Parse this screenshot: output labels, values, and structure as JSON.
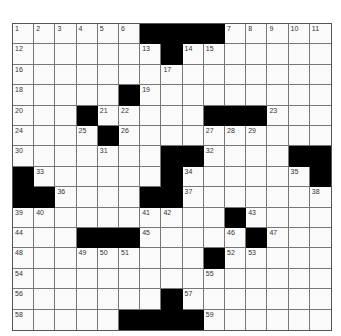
{
  "puzzle": {
    "rows": 15,
    "cols": 15,
    "colors": {
      "black": "#000000",
      "white": "#fafafa",
      "grid_line": "#777777"
    },
    "layout": [
      "......####.....",
      ".......#.......",
      "...............",
      ".....#.........",
      "...#.....###...",
      "....#..........",
      ".......##....##",
      "#......#......#",
      "##....##.......",
      "..........#....",
      "...###.....#...",
      ".........#.....",
      "...............",
      ".......#.......",
      ".....####......"
    ],
    "numbers": [
      {
        "r": 0,
        "c": 0,
        "n": "1"
      },
      {
        "r": 0,
        "c": 1,
        "n": "2"
      },
      {
        "r": 0,
        "c": 2,
        "n": "3"
      },
      {
        "r": 0,
        "c": 3,
        "n": "4"
      },
      {
        "r": 0,
        "c": 4,
        "n": "5"
      },
      {
        "r": 0,
        "c": 5,
        "n": "6"
      },
      {
        "r": 0,
        "c": 10,
        "n": "7"
      },
      {
        "r": 0,
        "c": 11,
        "n": "8"
      },
      {
        "r": 0,
        "c": 12,
        "n": "9"
      },
      {
        "r": 0,
        "c": 13,
        "n": "10"
      },
      {
        "r": 0,
        "c": 14,
        "n": "11"
      },
      {
        "r": 1,
        "c": 0,
        "n": "12"
      },
      {
        "r": 1,
        "c": 6,
        "n": "13"
      },
      {
        "r": 1,
        "c": 8,
        "n": "14"
      },
      {
        "r": 1,
        "c": 9,
        "n": "15"
      },
      {
        "r": 2,
        "c": 0,
        "n": "16"
      },
      {
        "r": 2,
        "c": 7,
        "n": "17"
      },
      {
        "r": 3,
        "c": 0,
        "n": "18"
      },
      {
        "r": 3,
        "c": 6,
        "n": "19"
      },
      {
        "r": 4,
        "c": 0,
        "n": "20"
      },
      {
        "r": 4,
        "c": 4,
        "n": "21"
      },
      {
        "r": 4,
        "c": 5,
        "n": "22"
      },
      {
        "r": 4,
        "c": 12,
        "n": "23"
      },
      {
        "r": 5,
        "c": 0,
        "n": "24"
      },
      {
        "r": 5,
        "c": 3,
        "n": "25"
      },
      {
        "r": 5,
        "c": 5,
        "n": "26"
      },
      {
        "r": 5,
        "c": 9,
        "n": "27"
      },
      {
        "r": 5,
        "c": 10,
        "n": "28"
      },
      {
        "r": 5,
        "c": 11,
        "n": "29"
      },
      {
        "r": 6,
        "c": 0,
        "n": "30"
      },
      {
        "r": 6,
        "c": 4,
        "n": "31"
      },
      {
        "r": 6,
        "c": 9,
        "n": "32"
      },
      {
        "r": 7,
        "c": 1,
        "n": "33"
      },
      {
        "r": 7,
        "c": 8,
        "n": "34"
      },
      {
        "r": 7,
        "c": 13,
        "n": "35"
      },
      {
        "r": 8,
        "c": 2,
        "n": "36"
      },
      {
        "r": 8,
        "c": 8,
        "n": "37"
      },
      {
        "r": 8,
        "c": 14,
        "n": "38"
      },
      {
        "r": 9,
        "c": 0,
        "n": "39"
      },
      {
        "r": 9,
        "c": 1,
        "n": "40"
      },
      {
        "r": 9,
        "c": 6,
        "n": "41"
      },
      {
        "r": 9,
        "c": 7,
        "n": "42"
      },
      {
        "r": 9,
        "c": 11,
        "n": "43"
      },
      {
        "r": 10,
        "c": 0,
        "n": "44"
      },
      {
        "r": 10,
        "c": 6,
        "n": "45"
      },
      {
        "r": 10,
        "c": 10,
        "n": "46"
      },
      {
        "r": 10,
        "c": 12,
        "n": "47"
      },
      {
        "r": 11,
        "c": 0,
        "n": "48"
      },
      {
        "r": 11,
        "c": 3,
        "n": "49"
      },
      {
        "r": 11,
        "c": 4,
        "n": "50"
      },
      {
        "r": 11,
        "c": 5,
        "n": "51"
      },
      {
        "r": 11,
        "c": 10,
        "n": "52"
      },
      {
        "r": 11,
        "c": 11,
        "n": "53"
      },
      {
        "r": 12,
        "c": 0,
        "n": "54"
      },
      {
        "r": 12,
        "c": 9,
        "n": "55"
      },
      {
        "r": 13,
        "c": 0,
        "n": "56"
      },
      {
        "r": 13,
        "c": 8,
        "n": "57"
      },
      {
        "r": 14,
        "c": 0,
        "n": "58"
      },
      {
        "r": 14,
        "c": 9,
        "n": "59"
      }
    ]
  }
}
